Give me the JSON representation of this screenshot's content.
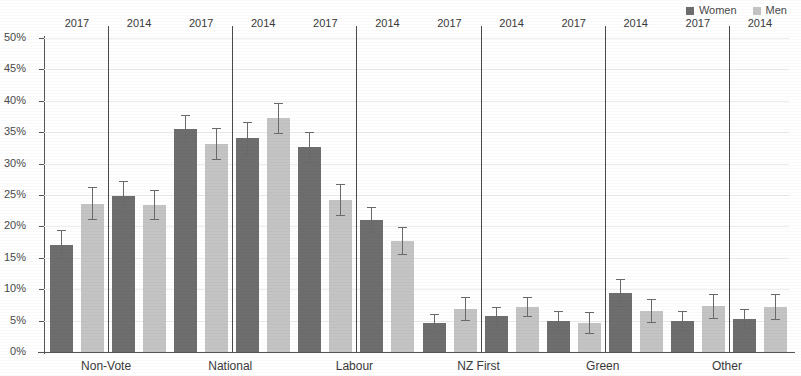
{
  "legend": {
    "entries": [
      {
        "label": "Women",
        "color": "#6e6e6e"
      },
      {
        "label": "Men",
        "color": "#c4c4c4"
      }
    ]
  },
  "axis": {
    "y_ticks": [
      "0%",
      "5%",
      "10%",
      "15%",
      "20%",
      "25%",
      "30%",
      "35%",
      "40%",
      "45%",
      "50%"
    ]
  },
  "year_labels": [
    "2017",
    "2014"
  ],
  "chart_data": {
    "type": "bar",
    "title": "",
    "xlabel": "",
    "ylabel": "",
    "ylim": [
      0,
      50
    ],
    "ytick_step": 5,
    "ytick_format": "percent",
    "grid": true,
    "legend_position": "top-right",
    "error_bars": "95% confidence interval",
    "categories": [
      "Non-Vote",
      "National",
      "Labour",
      "NZ First",
      "Green",
      "Other"
    ],
    "groups": [
      "2017",
      "2014"
    ],
    "series": [
      {
        "name": "Women",
        "color": "#6e6e6e",
        "values": {
          "2017": [
            17.1,
            35.5,
            32.6,
            4.6,
            4.9,
            5.0
          ],
          "2014": [
            24.8,
            34.0,
            21.0,
            5.7,
            9.4,
            5.2
          ]
        },
        "errors": {
          "2017": [
            2.3,
            2.3,
            2.5,
            1.5,
            1.6,
            1.6
          ],
          "2014": [
            2.5,
            2.6,
            2.1,
            1.5,
            2.3,
            1.6
          ]
        }
      },
      {
        "name": "Men",
        "color": "#c4c4c4",
        "values": {
          "2017": [
            23.6,
            33.1,
            24.2,
            6.8,
            4.6,
            7.3
          ],
          "2014": [
            23.4,
            37.2,
            17.7,
            7.1,
            6.5,
            7.2
          ]
        },
        "errors": {
          "2017": [
            2.6,
            2.6,
            2.5,
            1.9,
            1.7,
            2.0
          ],
          "2014": [
            2.4,
            2.5,
            2.2,
            1.6,
            1.9,
            2.1
          ]
        }
      }
    ]
  }
}
